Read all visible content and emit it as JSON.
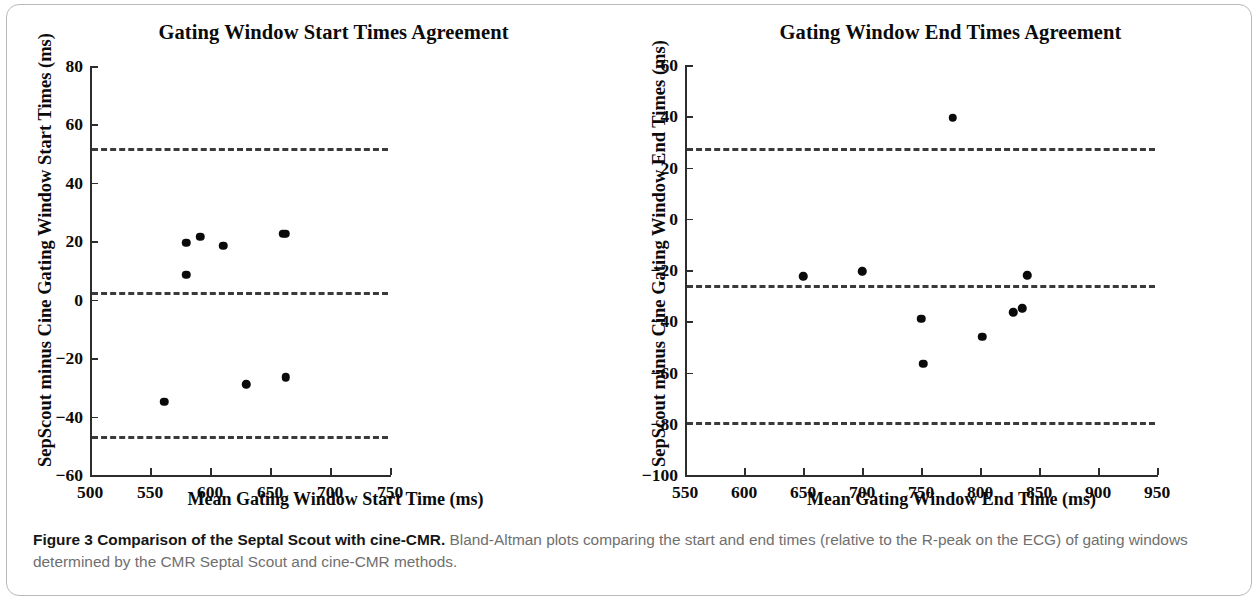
{
  "figure": {
    "caption_label": "Figure 3",
    "caption_title": "Comparison of the Septal Scout with cine-CMR.",
    "caption_body": " Bland-Altman plots comparing the start and end times (relative to the R-peak on the ECG) of gating windows determined by the CMR Septal Scout and cine-CMR methods."
  },
  "chart_data": [
    {
      "type": "scatter",
      "panel": "left",
      "title": "Gating Window Start Times Agreement",
      "xlabel": "Mean Gating Window Start Time (ms)",
      "ylabel": "SepScout minus Cine Gating Window Start Times (ms)",
      "xlim": [
        500,
        750
      ],
      "ylim": [
        -60,
        80
      ],
      "xticks": [
        500,
        550,
        600,
        650,
        700,
        750
      ],
      "xticklabels": [
        "500",
        "550",
        "600",
        "650",
        "700",
        "750"
      ],
      "yticks": [
        -60,
        -40,
        -20,
        0,
        20,
        40,
        60,
        80
      ],
      "yticklabels": [
        "-60",
        "-40",
        "-20",
        "0",
        "20",
        "40",
        "60",
        "80"
      ],
      "grid": false,
      "legend": "none",
      "reference_lines": [
        {
          "name": "upper-limit-of-agreement",
          "y": 52.0,
          "style": "dashed"
        },
        {
          "name": "mean-bias",
          "y": 2.5,
          "style": "dashed"
        },
        {
          "name": "lower-limit-of-agreement",
          "y": -46.5,
          "style": "dashed"
        }
      ],
      "x": [
        562,
        580,
        580,
        592,
        611,
        630,
        661,
        663,
        663
      ],
      "y": [
        -35,
        8.5,
        19.5,
        21.5,
        18.5,
        -29,
        22.5,
        22.5,
        -26.5
      ]
    },
    {
      "type": "scatter",
      "panel": "right",
      "title": "Gating Window End Times Agreement",
      "xlabel": "Mean Gating Window End Time (ms)",
      "ylabel": "SepScout minus Cine Gating Window End Times (ms)",
      "xlim": [
        550,
        950
      ],
      "ylim": [
        -100,
        60
      ],
      "xticks": [
        550,
        600,
        650,
        700,
        750,
        800,
        850,
        900,
        950
      ],
      "xticklabels": [
        "550",
        "600",
        "650",
        "700",
        "750",
        "800",
        "850",
        "900",
        "950"
      ],
      "yticks": [
        -100,
        -80,
        -60,
        -40,
        -20,
        0,
        20,
        40,
        60
      ],
      "yticklabels": [
        "-100",
        "-80",
        "-60",
        "-40",
        "-20",
        "0",
        "20",
        "40",
        "60"
      ],
      "grid": false,
      "legend": "none",
      "reference_lines": [
        {
          "name": "upper-limit-of-agreement",
          "y": 27.5,
          "style": "dashed"
        },
        {
          "name": "mean-bias",
          "y": -26.0,
          "style": "dashed"
        },
        {
          "name": "lower-limit-of-agreement",
          "y": -79.5,
          "style": "dashed"
        }
      ],
      "x": [
        650,
        700,
        750,
        752,
        777,
        802,
        828,
        836,
        840
      ],
      "y": [
        -22.5,
        -20.5,
        -39,
        -56.5,
        39.5,
        -46,
        -36.5,
        -35,
        -22
      ]
    }
  ]
}
